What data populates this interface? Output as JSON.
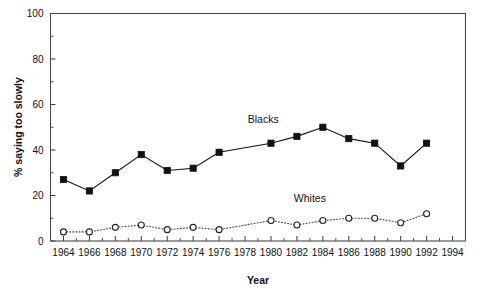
{
  "chart_data": {
    "type": "line",
    "title": "",
    "xlabel": "Year",
    "ylabel": "% saying too slowly",
    "xlim": [
      1963,
      1995
    ],
    "ylim": [
      0,
      100
    ],
    "grid": false,
    "legend_position": "inline-annotations",
    "x": [
      1964,
      1966,
      1968,
      1970,
      1972,
      1974,
      1976,
      1978,
      1980,
      1982,
      1984,
      1986,
      1988,
      1990,
      1992
    ],
    "xticks": [
      1964,
      1966,
      1968,
      1970,
      1972,
      1974,
      1976,
      1978,
      1980,
      1982,
      1984,
      1986,
      1988,
      1990,
      1992,
      1994
    ],
    "xtick_labels": [
      "1964",
      "1966",
      "1968",
      "1970",
      "1972",
      "1974",
      "1976",
      "1978",
      "1980",
      "1982",
      "1984",
      "1986",
      "1988",
      "1990",
      "1992",
      "1994"
    ],
    "xticks_minor": [
      1965,
      1967,
      1969,
      1971,
      1973,
      1975,
      1977,
      1979,
      1981,
      1983,
      1985,
      1987,
      1989,
      1991,
      1993
    ],
    "yticks": [
      0,
      20,
      40,
      60,
      80,
      100
    ],
    "ytick_labels": [
      "0",
      "20",
      "40",
      "60",
      "80",
      "100"
    ],
    "yticks_minor": [
      10,
      30,
      50,
      70,
      90
    ],
    "series": [
      {
        "name": "Blacks",
        "marker": "filled-square",
        "linestyle": "solid",
        "color": "#111111",
        "x": [
          1964,
          1966,
          1968,
          1970,
          1972,
          1974,
          1976,
          1980,
          1982,
          1984,
          1986,
          1988,
          1990,
          1992
        ],
        "values": [
          27,
          22,
          30,
          38,
          31,
          32,
          39,
          43,
          46,
          50,
          45,
          43,
          33,
          43
        ],
        "label_x": 1979.4,
        "label_y": 52
      },
      {
        "name": "Whites",
        "marker": "open-circle",
        "linestyle": "dotted",
        "color": "#444444",
        "x": [
          1964,
          1966,
          1968,
          1970,
          1972,
          1974,
          1976,
          1980,
          1982,
          1984,
          1986,
          1988,
          1990,
          1992
        ],
        "values": [
          4,
          4,
          6,
          7,
          5,
          6,
          5,
          9,
          7,
          9,
          10,
          10,
          8,
          12
        ],
        "label_x": 1983.0,
        "label_y": 17
      }
    ]
  }
}
